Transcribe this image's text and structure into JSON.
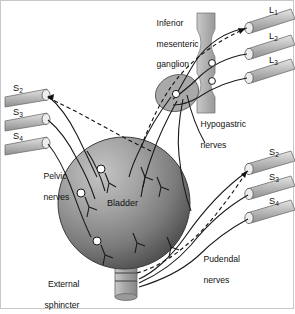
{
  "figure": {
    "background": "#ffffff",
    "border_color": "#c8c8c8"
  },
  "organs": {
    "bladder": {
      "label": "Bladder",
      "shape": "sphere",
      "fill_light": "#b9b9b9",
      "fill_dark": "#595959",
      "cx": 123,
      "cy": 202,
      "r": 66
    },
    "urethra": {
      "label": "External sphincter",
      "fill": "#a8a8a8",
      "band_count": 2
    },
    "spinal_cord": {
      "shape": "hourglass-column",
      "fill": "#b0b0b0"
    },
    "inferior_mesenteric_ganglion": {
      "label": "Inferior\nmesenteric\nganglion",
      "label_line1": "Inferior",
      "label_line2": "mesenteric",
      "label_line3": "ganglion",
      "fill": "#a9a9a9",
      "shape": "ellipse"
    }
  },
  "nerve_groups": [
    {
      "name": "lumbar-roots",
      "position": "top-right",
      "roots": [
        {
          "letter": "L",
          "number": "1"
        },
        {
          "letter": "L",
          "number": "2"
        },
        {
          "letter": "L",
          "number": "3"
        }
      ]
    },
    {
      "name": "sacral-roots-left",
      "position": "left",
      "roots": [
        {
          "letter": "S",
          "number": "2"
        },
        {
          "letter": "S",
          "number": "3"
        },
        {
          "letter": "S",
          "number": "4"
        }
      ]
    },
    {
      "name": "sacral-roots-right",
      "position": "right",
      "roots": [
        {
          "letter": "S",
          "number": "2"
        },
        {
          "letter": "S",
          "number": "3"
        },
        {
          "letter": "S",
          "number": "4"
        }
      ]
    }
  ],
  "nerve_labels": {
    "hypogastric": {
      "line1": "Hypogastric",
      "line2": "nerves"
    },
    "pelvic": {
      "line1": "Pelvic",
      "line2": "nerves"
    },
    "pudendal": {
      "line1": "Pudendal",
      "line2": "nerves"
    },
    "external_sphincter": {
      "line1": "External",
      "line2": "sphincter"
    },
    "bladder": "Bladder"
  },
  "colors": {
    "nerve_stroke": "#1a1a1a",
    "dashed_stroke": "#111111",
    "synapse_fill": "#ffffff",
    "text": "#111111"
  }
}
